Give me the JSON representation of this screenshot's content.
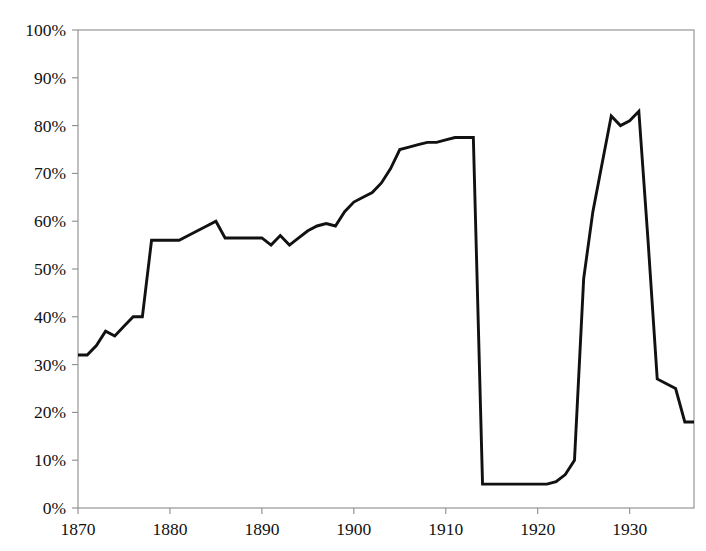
{
  "chart_data": {
    "type": "line",
    "title": "",
    "subtitle": "",
    "xlabel": "",
    "ylabel": "",
    "xlim": [
      1870,
      1937
    ],
    "ylim": [
      0,
      100
    ],
    "grid": false,
    "legend": false,
    "legend_position": "none",
    "y_tick_labels": [
      "100%",
      "90%",
      "80%",
      "70%",
      "60%",
      "50%",
      "40%",
      "30%",
      "20%",
      "10%",
      "0%"
    ],
    "y_tick_values": [
      100,
      90,
      80,
      70,
      60,
      50,
      40,
      30,
      20,
      10,
      0
    ],
    "x_tick_labels": [
      "1870",
      "1880",
      "1890",
      "1900",
      "1910",
      "1920",
      "1930"
    ],
    "x_tick_values": [
      1870,
      1880,
      1890,
      1900,
      1910,
      1920,
      1930
    ],
    "series": [
      {
        "name": "Share of world on the gold standard",
        "color": "#111111",
        "x": [
          1870,
          1871,
          1872,
          1873,
          1874,
          1875,
          1876,
          1877,
          1878,
          1879,
          1880,
          1881,
          1882,
          1883,
          1884,
          1885,
          1886,
          1887,
          1888,
          1889,
          1890,
          1891,
          1892,
          1893,
          1894,
          1895,
          1896,
          1897,
          1898,
          1899,
          1900,
          1901,
          1902,
          1903,
          1904,
          1905,
          1906,
          1907,
          1908,
          1909,
          1910,
          1911,
          1912,
          1913,
          1914,
          1915,
          1916,
          1917,
          1918,
          1919,
          1920,
          1921,
          1922,
          1923,
          1924,
          1925,
          1926,
          1927,
          1928,
          1929,
          1930,
          1931,
          1932,
          1933,
          1934,
          1935,
          1936,
          1937
        ],
        "values": [
          32,
          32,
          34,
          37,
          36,
          38,
          40,
          40,
          56,
          56,
          56,
          56,
          57,
          58,
          59,
          60,
          56.5,
          56.5,
          56.5,
          56.5,
          56.5,
          55,
          57,
          55,
          56.5,
          58,
          59,
          59.5,
          59,
          62,
          64,
          65,
          66,
          68,
          71,
          75,
          75.5,
          76,
          76.5,
          76.5,
          77,
          77.5,
          77.5,
          77.5,
          5,
          5,
          5,
          5,
          5,
          5,
          5,
          5,
          5.5,
          7,
          10,
          48,
          62,
          72,
          82,
          80,
          81,
          83,
          56,
          27,
          26,
          25,
          18,
          18
        ]
      }
    ],
    "annotations": [
      {
        "label": "collapse at outbreak of war",
        "x": 1914,
        "value": 5
      },
      {
        "label": "interwar peak",
        "x": 1931,
        "value": 83
      }
    ]
  }
}
